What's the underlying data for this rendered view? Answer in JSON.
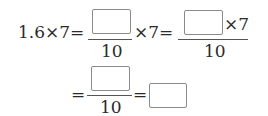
{
  "expression": {
    "row1": {
      "lhs": "1.6×7=",
      "frac1": {
        "numerator_blank": "",
        "denominator": "10"
      },
      "mult_after_frac1": "×7=",
      "frac2": {
        "numerator_blank": "",
        "numerator_suffix": "×7",
        "denominator": "10"
      }
    },
    "row2": {
      "eq1": "=",
      "frac3": {
        "numerator_blank": "",
        "denominator": "10"
      },
      "eq2": "=",
      "answer_blank": ""
    }
  }
}
